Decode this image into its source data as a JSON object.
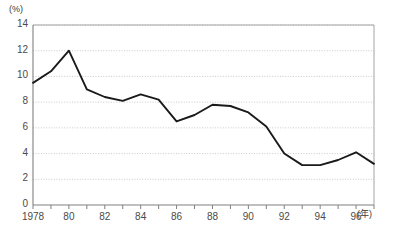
{
  "chart_data": {
    "type": "line",
    "title": "",
    "xlabel": "(年)",
    "ylabel": "(%)",
    "xlim": [
      1978,
      1997
    ],
    "ylim": [
      0,
      14
    ],
    "grid": true,
    "legend": "none",
    "x": [
      1978,
      1979,
      1980,
      1981,
      1982,
      1983,
      1984,
      1985,
      1986,
      1987,
      1988,
      1989,
      1990,
      1991,
      1992,
      1993,
      1994,
      1995,
      1996,
      1997
    ],
    "values": [
      9.5,
      10.4,
      12.0,
      9.0,
      8.4,
      8.1,
      8.6,
      8.2,
      6.5,
      7.0,
      7.8,
      7.7,
      7.2,
      6.1,
      4.0,
      3.1,
      3.1,
      3.5,
      4.1,
      3.2
    ],
    "series": [
      {
        "name": "",
        "color": "#1a1a1a",
        "values": [
          9.5,
          10.4,
          12.0,
          9.0,
          8.4,
          8.1,
          8.6,
          8.2,
          6.5,
          7.0,
          7.8,
          7.7,
          7.2,
          6.1,
          4.0,
          3.1,
          3.1,
          3.5,
          4.1,
          3.2
        ]
      }
    ],
    "y_ticks": [
      0,
      2,
      4,
      6,
      8,
      10,
      12,
      14
    ],
    "y_tick_labels": [
      "0",
      "2",
      "4",
      "6",
      "8",
      "10",
      "12",
      "14"
    ],
    "x_ticks": [
      1978,
      1979,
      1980,
      1981,
      1982,
      1983,
      1984,
      1985,
      1986,
      1987,
      1988,
      1989,
      1990,
      1991,
      1992,
      1993,
      1994,
      1995,
      1996,
      1997
    ],
    "x_tick_labels": [
      {
        "year": 1978,
        "label": "1978"
      },
      {
        "year": 1980,
        "label": "80"
      },
      {
        "year": 1982,
        "label": "82"
      },
      {
        "year": 1984,
        "label": "84"
      },
      {
        "year": 1986,
        "label": "86"
      },
      {
        "year": 1988,
        "label": "88"
      },
      {
        "year": 1990,
        "label": "90"
      },
      {
        "year": 1992,
        "label": "92"
      },
      {
        "year": 1994,
        "label": "94"
      },
      {
        "year": 1996,
        "label": "96"
      }
    ],
    "colors": {
      "line": "#1a1a1a",
      "axis": "#808080",
      "grid": "#bdbdbd",
      "tick_text": "#4a4a4a"
    }
  }
}
